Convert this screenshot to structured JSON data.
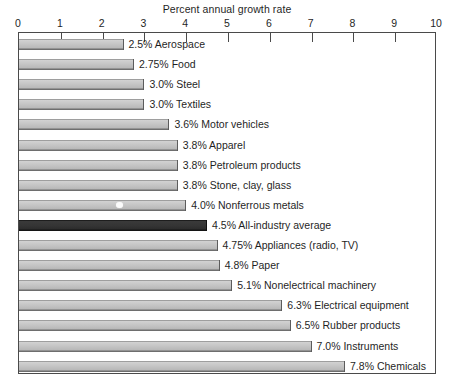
{
  "chart_data": {
    "type": "bar",
    "orientation": "horizontal",
    "title": "Percent annual growth rate",
    "xlabel": "Percent annual growth rate",
    "ylabel": "",
    "xlim": [
      0,
      10
    ],
    "xticks": [
      "0",
      "1",
      "2",
      "3",
      "4",
      "5",
      "6",
      "7",
      "8",
      "9",
      "10"
    ],
    "grid": false,
    "legend": "none",
    "value_suffix": "%",
    "highlight_color": "#2c2c2c",
    "bar_color": "#c2c2c2",
    "categories": [
      "Aerospace",
      "Food",
      "Steel",
      "Textiles",
      "Motor vehicles",
      "Apparel",
      "Petroleum products",
      "Stone, clay, glass",
      "Nonferrous metals",
      "All-industry average",
      "Appliances (radio, TV)",
      "Paper",
      "Nonelectrical machinery",
      "Electrical equipment",
      "Rubber products",
      "Instruments",
      "Chemicals"
    ],
    "values": [
      2.5,
      2.75,
      3.0,
      3.0,
      3.6,
      3.8,
      3.8,
      3.8,
      4.0,
      4.5,
      4.75,
      4.8,
      5.1,
      6.3,
      6.5,
      7.0,
      7.8
    ],
    "bars": [
      {
        "value": 2.5,
        "value_text": "2.5%",
        "category": "Aerospace",
        "label": "2.5% Aerospace",
        "highlight": false
      },
      {
        "value": 2.75,
        "value_text": "2.75%",
        "category": "Food",
        "label": "2.75% Food",
        "highlight": false
      },
      {
        "value": 3.0,
        "value_text": "3.0%",
        "category": "Steel",
        "label": "3.0% Steel",
        "highlight": false
      },
      {
        "value": 3.0,
        "value_text": "3.0%",
        "category": "Textiles",
        "label": "3.0% Textiles",
        "highlight": false
      },
      {
        "value": 3.6,
        "value_text": "3.6%",
        "category": "Motor vehicles",
        "label": "3.6% Motor vehicles",
        "highlight": false
      },
      {
        "value": 3.8,
        "value_text": "3.8%",
        "category": "Apparel",
        "label": "3.8% Apparel",
        "highlight": false
      },
      {
        "value": 3.8,
        "value_text": "3.8%",
        "category": "Petroleum products",
        "label": "3.8% Petroleum products",
        "highlight": false
      },
      {
        "value": 3.8,
        "value_text": "3.8%",
        "category": "Stone, clay, glass",
        "label": "3.8% Stone, clay, glass",
        "highlight": false
      },
      {
        "value": 4.0,
        "value_text": "4.0%",
        "category": "Nonferrous metals",
        "label": "4.0% Nonferrous metals",
        "highlight": false
      },
      {
        "value": 4.5,
        "value_text": "4.5%",
        "category": "All-industry average",
        "label": "4.5% All-industry average",
        "highlight": true
      },
      {
        "value": 4.75,
        "value_text": "4.75%",
        "category": "Appliances (radio, TV)",
        "label": "4.75% Appliances (radio, TV)",
        "highlight": false
      },
      {
        "value": 4.8,
        "value_text": "4.8%",
        "category": "Paper",
        "label": "4.8% Paper",
        "highlight": false
      },
      {
        "value": 5.1,
        "value_text": "5.1%",
        "category": "Nonelectrical machinery",
        "label": "5.1% Nonelectrical machinery",
        "highlight": false
      },
      {
        "value": 6.3,
        "value_text": "6.3%",
        "category": "Electrical equipment",
        "label": "6.3% Electrical equipment",
        "highlight": false
      },
      {
        "value": 6.5,
        "value_text": "6.5%",
        "category": "Rubber products",
        "label": "6.5% Rubber products",
        "highlight": false
      },
      {
        "value": 7.0,
        "value_text": "7.0%",
        "category": "Instruments",
        "label": "7.0% Instruments",
        "highlight": false
      },
      {
        "value": 7.8,
        "value_text": "7.8%",
        "category": "Chemicals",
        "label": "7.8% Chemicals",
        "highlight": false
      }
    ]
  }
}
